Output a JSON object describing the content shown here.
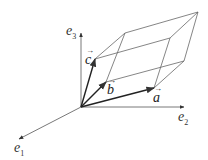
{
  "diagram": {
    "axes": [
      {
        "name": "e1",
        "base": "e",
        "sub": "1"
      },
      {
        "name": "e2",
        "base": "e",
        "sub": "2"
      },
      {
        "name": "e3",
        "base": "e",
        "sub": "3"
      }
    ],
    "vectors": [
      {
        "name": "a",
        "label": "a",
        "arrow": "→"
      },
      {
        "name": "b",
        "label": "b",
        "arrow": "→"
      },
      {
        "name": "c",
        "label": "c",
        "arrow": "→"
      }
    ],
    "colors": {
      "axis": "#555555",
      "vector": "#222222",
      "edge": "#666666"
    }
  }
}
